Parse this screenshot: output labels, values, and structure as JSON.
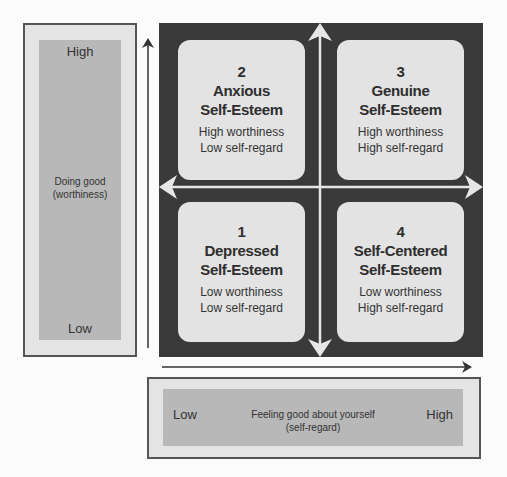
{
  "vertical_axis": {
    "high_label": "High",
    "low_label": "Low",
    "label_line1": "Doing good",
    "label_line2": "(worthiness)"
  },
  "horizontal_axis": {
    "low_label": "Low",
    "high_label": "High",
    "label_line1": "Feeling good about yourself",
    "label_line2": "(self-regard)"
  },
  "quadrants": [
    {
      "position": "top-left",
      "number": "2",
      "title_line1": "Anxious",
      "title_line2": "Self-Esteem",
      "desc_line1": "High worthiness",
      "desc_line2": "Low self-regard"
    },
    {
      "position": "top-right",
      "number": "3",
      "title_line1": "Genuine",
      "title_line2": "Self-Esteem",
      "desc_line1": "High worthiness",
      "desc_line2": "High self-regard"
    },
    {
      "position": "bottom-left",
      "number": "1",
      "title_line1": "Depressed",
      "title_line2": "Self-Esteem",
      "desc_line1": "Low worthiness",
      "desc_line2": "Low self-regard"
    },
    {
      "position": "bottom-right",
      "number": "4",
      "title_line1": "Self-Centered",
      "title_line2": "Self-Esteem",
      "desc_line1": "Low worthiness",
      "desc_line2": "High self-regard"
    }
  ],
  "colors": {
    "matrix_background": "#3a3a3a",
    "card_background": "#e3e3e3",
    "axis_panel_outer": "#e4e4e4",
    "axis_panel_inner": "#b8b8b8",
    "arrow": "#333333",
    "cross_arrows": "#e6e6e6"
  }
}
